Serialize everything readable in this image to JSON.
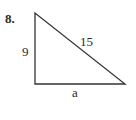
{
  "problem": {
    "number": "8.",
    "figure": "right-triangle",
    "labels": {
      "vertical_leg": "9",
      "hypotenuse": "15",
      "horizontal_leg": "a"
    }
  }
}
